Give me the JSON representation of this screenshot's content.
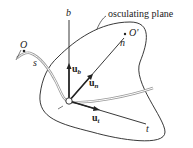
{
  "diagram": {
    "title_label": "osculating plane",
    "origin_label": "O",
    "center_label": "O'",
    "arc_length_label": "s",
    "axes": {
      "binormal": "b",
      "normal": "n",
      "tangent": "t"
    },
    "unit_vectors": {
      "binormal": {
        "base": "u",
        "sub": "b"
      },
      "normal": {
        "base": "u",
        "sub": "n"
      },
      "tangent": {
        "base": "u",
        "sub": "t"
      }
    },
    "colors": {
      "lines": "#222222",
      "curve": "#9a9a9a",
      "background": "#ffffff"
    }
  }
}
